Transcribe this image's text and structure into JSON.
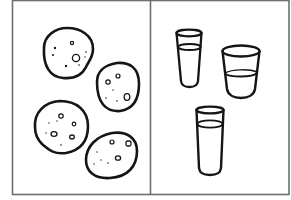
{
  "figure": {
    "description": "Two-panel line drawing: cookies on the left, glasses of liquid on the right",
    "colors": {
      "background": "#ffffff",
      "frame": "#6e6e6e",
      "ink": "#151515"
    },
    "panels": [
      {
        "name": "cookies",
        "count": 4,
        "items": [
          {
            "label": "cookie-1",
            "cx": 68,
            "cy": 52,
            "rx": 26,
            "ry": 24
          },
          {
            "label": "cookie-2",
            "cx": 118,
            "cy": 87,
            "rx": 22,
            "ry": 24
          },
          {
            "label": "cookie-3",
            "cx": 61,
            "cy": 124,
            "rx": 27,
            "ry": 26
          },
          {
            "label": "cookie-4",
            "cx": 111,
            "cy": 156,
            "rx": 26,
            "ry": 23
          }
        ]
      },
      {
        "name": "glasses",
        "count": 3,
        "items": [
          {
            "label": "glass-1",
            "fill": "two-thirds full"
          },
          {
            "label": "glass-2",
            "fill": "half full"
          },
          {
            "label": "glass-3",
            "fill": "nearly full"
          }
        ]
      }
    ]
  }
}
